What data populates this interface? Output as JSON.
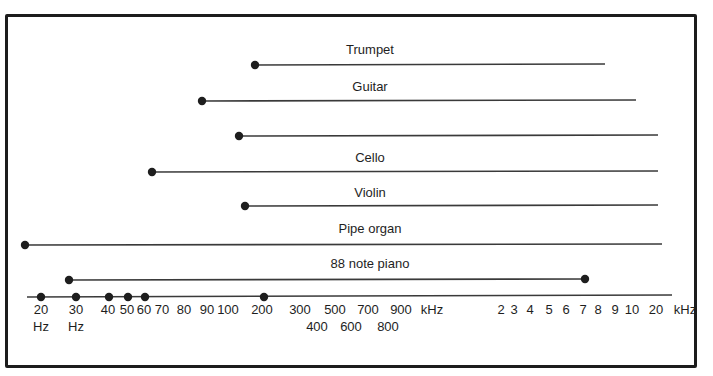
{
  "chart_data": {
    "type": "range",
    "title": "",
    "ranges": [
      {
        "name": "Trumpet",
        "label": "Trumpet",
        "start_label": "~180 Hz",
        "end_label": "~8 kHz",
        "x1": 255,
        "x2": 605,
        "y": 65,
        "label_y": 54
      },
      {
        "name": "Guitar",
        "label": "Guitar",
        "start_label": "~80 Hz",
        "end_label": "~11 kHz",
        "x1": 202,
        "x2": 636,
        "y": 101,
        "label_y": 91
      },
      {
        "name": "(unlabeled)",
        "label": "",
        "start_label": "~130 Hz",
        "end_label": "~20 kHz",
        "x1": 239,
        "x2": 658,
        "y": 136,
        "label_y": 126
      },
      {
        "name": "Cello",
        "label": "Cello",
        "start_label": "~65 Hz",
        "end_label": "~20 kHz",
        "x1": 152,
        "x2": 658,
        "y": 172,
        "label_y": 162
      },
      {
        "name": "Violin",
        "label": "Violin",
        "start_label": "~196 Hz",
        "end_label": "~20 kHz",
        "x1": 245,
        "x2": 658,
        "y": 206,
        "label_y": 197
      },
      {
        "name": "Pipe organ",
        "label": "Pipe organ",
        "start_label": "~16 Hz",
        "end_label": "~20 kHz",
        "x1": 25,
        "x2": 662,
        "y": 245,
        "label_y": 233
      },
      {
        "name": "88 note piano",
        "label": "88 note piano",
        "start_label": "~27.5 Hz",
        "end_label": "~7 kHz",
        "x1": 69,
        "x2": 585,
        "y": 280,
        "label_y": 268,
        "end_dot": true
      }
    ],
    "axis": {
      "x1": 27,
      "x2": 672,
      "y": 297,
      "dots": [
        41,
        76,
        109,
        128,
        145,
        264
      ],
      "ticks_row1": [
        {
          "text": "20",
          "x": 41
        },
        {
          "text": "30",
          "x": 76
        },
        {
          "text": "40",
          "x": 108
        },
        {
          "text": "50",
          "x": 127
        },
        {
          "text": "60",
          "x": 144
        },
        {
          "text": "70",
          "x": 162
        },
        {
          "text": "80",
          "x": 184
        },
        {
          "text": "90",
          "x": 207
        },
        {
          "text": "100",
          "x": 228
        },
        {
          "text": "200",
          "x": 262
        },
        {
          "text": "300",
          "x": 300
        },
        {
          "text": "500",
          "x": 335
        },
        {
          "text": "700",
          "x": 368
        },
        {
          "text": "900",
          "x": 401
        },
        {
          "text": "kHz",
          "x": 432
        },
        {
          "text": "2",
          "x": 501
        },
        {
          "text": "3",
          "x": 514
        },
        {
          "text": "4",
          "x": 530
        },
        {
          "text": "5",
          "x": 549
        },
        {
          "text": "6",
          "x": 566
        },
        {
          "text": "7",
          "x": 583
        },
        {
          "text": "8",
          "x": 598
        },
        {
          "text": "9",
          "x": 615
        },
        {
          "text": "10",
          "x": 632
        },
        {
          "text": "20",
          "x": 656
        },
        {
          "text": "kHz",
          "x": 685
        }
      ],
      "ticks_row2": [
        {
          "text": "Hz",
          "x": 41
        },
        {
          "text": "Hz",
          "x": 76
        },
        {
          "text": "400",
          "x": 317
        },
        {
          "text": "600",
          "x": 351
        },
        {
          "text": "800",
          "x": 388
        }
      ]
    },
    "xlabel": "Frequency",
    "scale": "logarithmic"
  },
  "colors": {
    "ink": "#1e1e1e",
    "line": "#3a3a3a",
    "background": "#ffffff"
  }
}
